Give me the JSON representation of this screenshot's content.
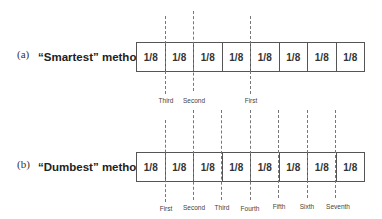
{
  "panel_a": {
    "tag": "(a)",
    "title": "“Smartest” method",
    "cells": [
      "1/8",
      "1/8",
      "1/8",
      "1/8",
      "1/8",
      "1/8",
      "1/8",
      "1/8"
    ],
    "cuts": [
      {
        "label": "Third",
        "after_cell": 1
      },
      {
        "label": "Second",
        "after_cell": 2
      },
      {
        "label": "First",
        "after_cell": 4
      }
    ]
  },
  "panel_b": {
    "tag": "(b)",
    "title": "“Dumbest” method",
    "cells": [
      "1/8",
      "1/8",
      "1/8",
      "1/8",
      "1/8",
      "1/8",
      "1/8",
      "1/8"
    ],
    "cuts": [
      {
        "label": "First",
        "after_cell": 1
      },
      {
        "label": "Second",
        "after_cell": 2
      },
      {
        "label": "Third",
        "after_cell": 3
      },
      {
        "label": "Fourth",
        "after_cell": 4
      },
      {
        "label": "Fifth",
        "after_cell": 5
      },
      {
        "label": "Sixth",
        "after_cell": 6
      },
      {
        "label": "Seventh",
        "after_cell": 7
      }
    ]
  }
}
